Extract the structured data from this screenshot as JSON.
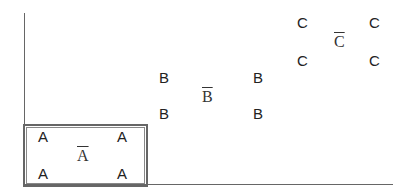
{
  "diagram": {
    "type": "clusters-with-centroids",
    "axes": {
      "x_axis": true,
      "y_axis": true
    },
    "groups": [
      {
        "name": "A",
        "points": [
          "A",
          "A",
          "A",
          "A"
        ],
        "centroid": "A",
        "highlighted_box": true
      },
      {
        "name": "B",
        "points": [
          "B",
          "B",
          "B",
          "B"
        ],
        "centroid": "B",
        "highlighted_box": false
      },
      {
        "name": "C",
        "points": [
          "C",
          "C",
          "C",
          "C"
        ],
        "centroid": "C",
        "highlighted_box": false
      }
    ]
  }
}
